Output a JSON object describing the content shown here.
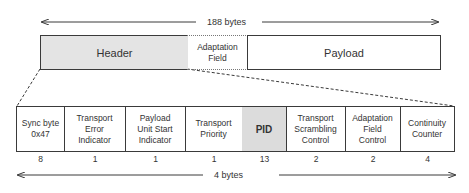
{
  "top": {
    "length_label": "188 bytes",
    "segments": [
      {
        "label": "Header",
        "fill": "#e4e4e4"
      },
      {
        "label": "Adaptation\nField",
        "fill": "#ffffff"
      },
      {
        "label": "Payload",
        "fill": "#ffffff"
      }
    ]
  },
  "header_fields": [
    {
      "label": "Sync byte\n0x47",
      "bits": "8"
    },
    {
      "label": "Transport\nError\nIndicator",
      "bits": "1"
    },
    {
      "label": "Payload\nUnit Start\nIndicator",
      "bits": "1"
    },
    {
      "label": "Transport\nPriority",
      "bits": "1"
    },
    {
      "label": "PID",
      "bits": "13"
    },
    {
      "label": "Transport\nScrambling\nControl",
      "bits": "2"
    },
    {
      "label": "Adaptation\nField\nControl",
      "bits": "2"
    },
    {
      "label": "Continuity\nCounter",
      "bits": "4"
    }
  ],
  "bottom": {
    "length_label": "4 bytes"
  },
  "colors": {
    "header_fill": "#e4e4e4",
    "pid_fill": "#dcdcdc",
    "line": "#3a3a3a"
  }
}
